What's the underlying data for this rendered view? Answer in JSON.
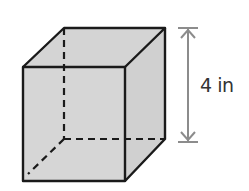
{
  "figure": {
    "shape": "cube",
    "dimension_label": "4 in",
    "colors": {
      "face_fill": "#d4d4d4",
      "edge": "#1a1a1a",
      "dimension_line": "#8c8c8c"
    }
  }
}
